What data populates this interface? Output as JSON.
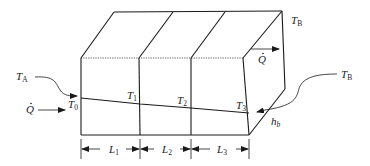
{
  "figure": {
    "labels": {
      "T_A": {
        "main": "T",
        "sub": "A"
      },
      "T_B_top": {
        "main": "T",
        "sub": "B"
      },
      "T_B_right": {
        "main": "T",
        "sub": "B"
      },
      "Q_dot_left": {
        "main": "Q"
      },
      "Q_dot_top": {
        "main": "Q"
      },
      "T0": {
        "main": "T",
        "sub": "0"
      },
      "T1": {
        "main": "T",
        "sub": "1"
      },
      "T2": {
        "main": "T",
        "sub": "2"
      },
      "T3": {
        "main": "T",
        "sub": "3"
      },
      "h_b": {
        "main": "h",
        "sub": "b"
      },
      "L1": {
        "main": "L",
        "sub": "1"
      },
      "L2": {
        "main": "L",
        "sub": "2"
      },
      "L3": {
        "main": "L",
        "sub": "3"
      }
    },
    "layers": [
      "L1",
      "L2",
      "L3"
    ],
    "colors": {
      "line": "#1a1a1a",
      "background": "#ffffff"
    }
  }
}
